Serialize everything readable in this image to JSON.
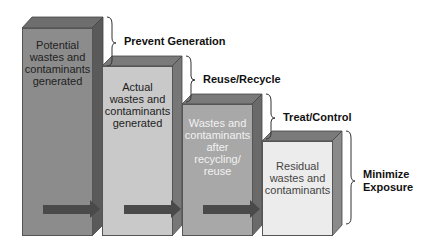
{
  "stages": [
    {
      "label": "Potential\nwastes and\ncontaminants\ngenerated",
      "color": "#8c8c8c"
    },
    {
      "label": "Actual\nwastes and\ncontaminants\ngenerated",
      "color": "#c9c9c9"
    },
    {
      "label": "Wastes and\ncontaminants\nafter\nrecycling/\nreuse",
      "color": "#a8a8a8"
    },
    {
      "label": "Residual\nwastes and\ncontaminants",
      "color": "#ececec"
    }
  ],
  "steps": [
    {
      "label": "Prevent Generation"
    },
    {
      "label": "Reuse/Recycle"
    },
    {
      "label": "Treat/Control"
    },
    {
      "label": "Minimize\nExposure"
    }
  ],
  "colors": {
    "arrow": "#4a4a4a",
    "side": "#5a5a5a",
    "top": "#6e6e6e"
  }
}
